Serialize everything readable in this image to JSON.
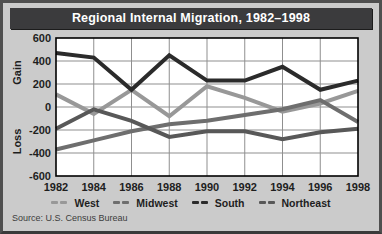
{
  "title": "Regional Internal Migration, 1982–1998",
  "source": "Source: U.S. Census Bureau",
  "colors": {
    "frame": "#4f4f4f",
    "background": "#cbcbcb",
    "title_bar": "#3b3b3d",
    "title_text": "#ffffff",
    "plot_background": "#ffffff",
    "grid": "#8f8f8f",
    "plot_border": "#000000",
    "axis_text": "#1e1e1e"
  },
  "chart_data": {
    "type": "line",
    "title": "Regional Internal Migration, 1982–1998",
    "x": [
      1982,
      1984,
      1986,
      1988,
      1990,
      1992,
      1994,
      1996,
      1998
    ],
    "ylim": [
      -600,
      600
    ],
    "ytick_step": 200,
    "ylabel_top": "Gain",
    "ylabel_bottom": "Loss",
    "grid": true,
    "legend_position": "bottom",
    "series": [
      {
        "name": "West",
        "color": "#989898",
        "values": [
          110,
          -60,
          150,
          -80,
          180,
          80,
          -40,
          30,
          140
        ]
      },
      {
        "name": "Midwest",
        "color": "#6e6e6e",
        "values": [
          -370,
          -290,
          -210,
          -150,
          -120,
          -70,
          -20,
          60,
          -130
        ]
      },
      {
        "name": "South",
        "color": "#2b2b2b",
        "values": [
          470,
          430,
          150,
          450,
          230,
          230,
          350,
          150,
          230
        ]
      },
      {
        "name": "Northeast",
        "color": "#585858",
        "values": [
          -190,
          -20,
          -120,
          -260,
          -210,
          -210,
          -280,
          -220,
          -190
        ]
      }
    ],
    "draw_order": [
      0,
      1,
      3,
      2
    ]
  }
}
